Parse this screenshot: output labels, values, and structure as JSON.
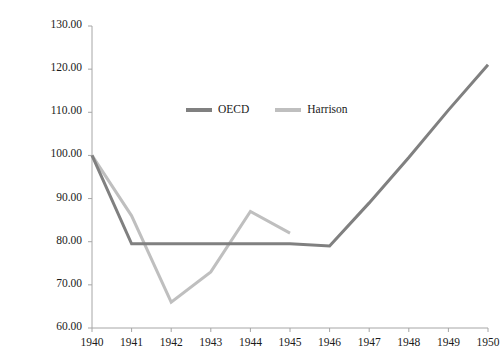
{
  "chart_data": {
    "type": "line",
    "title": "",
    "xlabel": "",
    "ylabel": "Index, 1940 = 100",
    "x": [
      1940,
      1941,
      1942,
      1943,
      1944,
      1945,
      1946,
      1947,
      1948,
      1949,
      1950
    ],
    "xtick_labels": [
      "1940",
      "1941",
      "1942",
      "1943",
      "1944",
      "1945",
      "1946",
      "1947",
      "1948",
      "1949",
      "1950"
    ],
    "ytick_labels": [
      "60.00",
      "70.00",
      "80.00",
      "90.00",
      "100.00",
      "110.00",
      "120.00",
      "130.00"
    ],
    "ytick_values": [
      60,
      70,
      80,
      90,
      100,
      110,
      120,
      130
    ],
    "ylim": [
      60,
      130
    ],
    "xlim": [
      1940,
      1950
    ],
    "grid": false,
    "legend_position": "inside-top-center",
    "series": [
      {
        "name": "OECD",
        "color": "#808080",
        "values": [
          100.0,
          79.5,
          79.5,
          79.5,
          79.5,
          79.5,
          79.0,
          89.0,
          99.5,
          110.5,
          121.0
        ]
      },
      {
        "name": "Harrison",
        "color": "#bfbfbf",
        "values": [
          100.0,
          86.0,
          66.0,
          73.0,
          87.0,
          82.0,
          null,
          null,
          null,
          null,
          null
        ]
      }
    ]
  },
  "axis": {
    "line_color": "#a6a6a6",
    "tick_color": "#a6a6a6"
  }
}
